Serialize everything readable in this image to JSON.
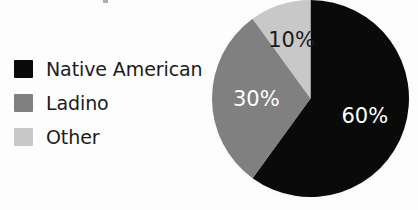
{
  "chart_data": {
    "type": "pie",
    "title": "",
    "categories": [
      "Native American",
      "Ladino",
      "Other"
    ],
    "values": [
      60,
      30,
      10
    ],
    "value_labels": [
      "60%",
      "30%",
      "10%"
    ],
    "unit": "percent",
    "start_angle_deg": 0,
    "direction": "clockwise",
    "legend_position": "left",
    "grid": false,
    "colors": [
      "#0a0a0a",
      "#808080",
      "#c8c8c8"
    ],
    "label_colors": [
      "#ffffff",
      "#ffffff",
      "#1a1a1a"
    ],
    "slices": [
      {
        "label": "Native American",
        "value": 60,
        "value_label": "60%",
        "color": "#0a0a0a",
        "label_color": "#ffffff"
      },
      {
        "label": "Ladino",
        "value": 30,
        "value_label": "30%",
        "color": "#808080",
        "label_color": "#ffffff"
      },
      {
        "label": "Other",
        "value": 10,
        "value_label": "10%",
        "color": "#c8c8c8",
        "label_color": "#1a1a1a"
      }
    ]
  },
  "legend": {
    "items": [
      {
        "label": "Native American",
        "color": "#0a0a0a"
      },
      {
        "label": "Ladino",
        "color": "#808080"
      },
      {
        "label": "Other",
        "color": "#c8c8c8"
      }
    ]
  }
}
